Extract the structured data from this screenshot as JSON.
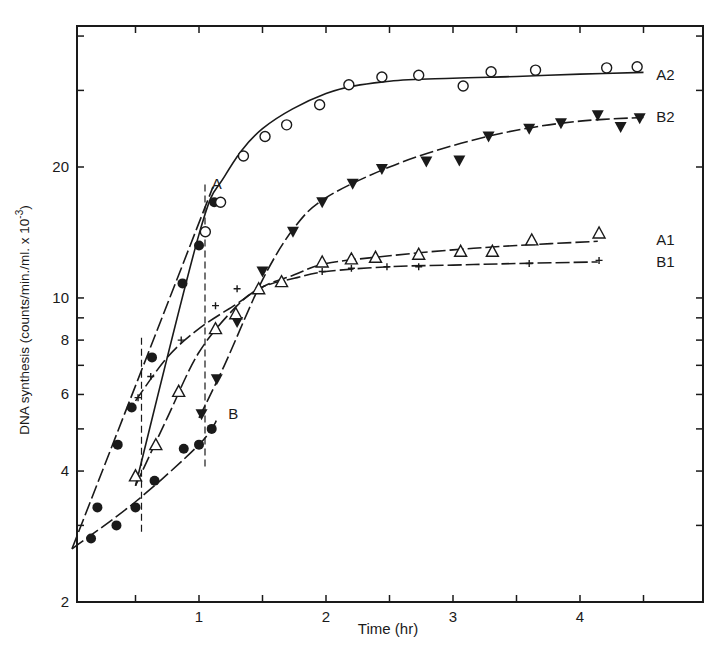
{
  "chart_data": {
    "type": "line",
    "title": "",
    "xlabel": "Time (hr)",
    "ylabel": "DNA synthesis (counts/min./ml. x 10",
    "ylabel_exponent": "-3",
    "ylabel_close": ")",
    "xlim": [
      0,
      4.9
    ],
    "ylim": [
      2,
      41
    ],
    "yscale": "log",
    "grid": false,
    "legend": "inline labels at curve ends",
    "x_ticks": [
      0.5,
      1,
      1.5,
      2,
      2.5,
      3,
      3.5,
      4,
      4.5
    ],
    "x_tick_labels": [
      {
        "v": 1,
        "t": "1"
      },
      {
        "v": 2,
        "t": "2"
      },
      {
        "v": 3,
        "t": "3"
      },
      {
        "v": 4,
        "t": "4"
      }
    ],
    "y_ticks": [
      2,
      3,
      4,
      5,
      6,
      7,
      8,
      9,
      10,
      20,
      30,
      40
    ],
    "y_tick_labels": [
      {
        "v": 2,
        "t": "2"
      },
      {
        "v": 4,
        "t": "4"
      },
      {
        "v": 6,
        "t": "6"
      },
      {
        "v": 8,
        "t": "8"
      },
      {
        "v": 10,
        "t": "10"
      },
      {
        "v": 20,
        "t": "20"
      }
    ],
    "vertical_dashed_lines": [
      {
        "x": 0.5,
        "y_from": 2.9,
        "y_to": 8.1
      },
      {
        "x": 1.0,
        "y_from": 4.1,
        "y_to": 18.5
      }
    ],
    "series": [
      {
        "name": "A",
        "marker": "filled-circle",
        "line": "dashed",
        "label_at": {
          "x": 1.1,
          "y": 18.3
        },
        "curve": [
          [
            0,
            2.65
          ],
          [
            1.11,
            18
          ]
        ],
        "points": [
          [
            0.2,
            3.3
          ],
          [
            0.36,
            4.6
          ],
          [
            0.47,
            5.6
          ],
          [
            0.63,
            7.3
          ],
          [
            0.87,
            10.8
          ],
          [
            1.0,
            13.2
          ],
          [
            1.12,
            16.6
          ]
        ]
      },
      {
        "name": "B",
        "marker": "filled-circle",
        "line": "dashed",
        "label_at": {
          "x": 1.23,
          "y": 5.4
        },
        "curve": [
          [
            0,
            2.65
          ],
          [
            0.5,
            3.4
          ],
          [
            1.0,
            4.6
          ],
          [
            1.15,
            5.3
          ]
        ],
        "points": [
          [
            0.15,
            2.8
          ],
          [
            0.35,
            3.0
          ],
          [
            0.5,
            3.3
          ],
          [
            0.65,
            3.8
          ],
          [
            0.88,
            4.5
          ],
          [
            1.0,
            4.6
          ],
          [
            1.1,
            5.0
          ]
        ]
      },
      {
        "name": "A2",
        "marker": "open-circle",
        "line": "solid",
        "label_at": {
          "x": 4.6,
          "y": 32.5
        },
        "curve": [
          [
            0.5,
            3.7
          ],
          [
            1.0,
            14.0
          ],
          [
            1.2,
            19.0
          ],
          [
            1.5,
            24.5
          ],
          [
            2.0,
            29.5
          ],
          [
            2.5,
            31.5
          ],
          [
            3.0,
            32.0
          ],
          [
            3.5,
            32.3
          ],
          [
            4.0,
            32.7
          ],
          [
            4.5,
            33.0
          ]
        ],
        "points": [
          [
            1.05,
            14.2
          ],
          [
            1.17,
            16.6
          ],
          [
            1.35,
            21.2
          ],
          [
            1.52,
            23.5
          ],
          [
            1.69,
            25.0
          ],
          [
            1.95,
            27.8
          ],
          [
            2.18,
            30.9
          ],
          [
            2.44,
            32.2
          ],
          [
            2.73,
            32.5
          ],
          [
            3.08,
            30.7
          ],
          [
            3.3,
            33.1
          ],
          [
            3.65,
            33.4
          ],
          [
            4.21,
            33.8
          ],
          [
            4.45,
            34.0
          ]
        ]
      },
      {
        "name": "B2",
        "marker": "filled-triangle-down",
        "line": "dashed",
        "label_at": {
          "x": 4.6,
          "y": 26.0
        },
        "curve": [
          [
            1.0,
            5.3
          ],
          [
            1.2,
            7.0
          ],
          [
            1.5,
            11.0
          ],
          [
            1.75,
            14.5
          ],
          [
            2.0,
            17.0
          ],
          [
            2.5,
            20.0
          ],
          [
            3.0,
            22.4
          ],
          [
            3.5,
            24.3
          ],
          [
            4.0,
            25.5
          ],
          [
            4.5,
            26.0
          ]
        ],
        "points": [
          [
            1.02,
            5.4
          ],
          [
            1.14,
            6.5
          ],
          [
            1.3,
            8.8
          ],
          [
            1.5,
            11.5
          ],
          [
            1.74,
            14.2
          ],
          [
            1.97,
            16.6
          ],
          [
            2.21,
            18.3
          ],
          [
            2.44,
            19.8
          ],
          [
            2.79,
            20.6
          ],
          [
            3.05,
            20.7
          ],
          [
            3.28,
            23.5
          ],
          [
            3.6,
            24.5
          ],
          [
            3.85,
            25.2
          ],
          [
            4.14,
            26.3
          ],
          [
            4.32,
            24.7
          ],
          [
            4.47,
            25.9
          ]
        ]
      },
      {
        "name": "A1",
        "marker": "open-triangle",
        "line": "dashed",
        "label_at": {
          "x": 4.6,
          "y": 13.6
        },
        "curve": [
          [
            0.5,
            3.7
          ],
          [
            0.75,
            5.3
          ],
          [
            1.0,
            7.5
          ],
          [
            1.3,
            9.6
          ],
          [
            1.5,
            10.6
          ],
          [
            1.75,
            11.3
          ],
          [
            2.0,
            12.0
          ],
          [
            2.5,
            12.5
          ],
          [
            3.0,
            12.9
          ],
          [
            3.5,
            13.2
          ],
          [
            4.14,
            13.5
          ]
        ],
        "points": [
          [
            0.5,
            3.9
          ],
          [
            0.66,
            4.6
          ],
          [
            0.84,
            6.1
          ],
          [
            1.13,
            8.5
          ],
          [
            1.29,
            9.2
          ],
          [
            1.47,
            10.5
          ],
          [
            1.65,
            10.9
          ],
          [
            1.97,
            12.1
          ],
          [
            2.2,
            12.3
          ],
          [
            2.39,
            12.4
          ],
          [
            2.73,
            12.6
          ],
          [
            3.06,
            12.8
          ],
          [
            3.31,
            12.8
          ],
          [
            3.62,
            13.6
          ],
          [
            4.15,
            14.1
          ]
        ]
      },
      {
        "name": "B1",
        "marker": "plus",
        "line": "dashed",
        "label_at": {
          "x": 4.6,
          "y": 12.1
        },
        "curve": [
          [
            0.5,
            5.8
          ],
          [
            0.75,
            7.3
          ],
          [
            1.0,
            8.5
          ],
          [
            1.3,
            9.7
          ],
          [
            1.5,
            10.6
          ],
          [
            1.75,
            11.1
          ],
          [
            2.0,
            11.5
          ],
          [
            2.5,
            11.8
          ],
          [
            3.0,
            11.9
          ],
          [
            3.5,
            12.0
          ],
          [
            4.14,
            12.1
          ]
        ],
        "points": [
          [
            0.52,
            5.9
          ],
          [
            0.62,
            6.6
          ],
          [
            0.86,
            8.0
          ],
          [
            1.13,
            9.6
          ],
          [
            1.3,
            10.5
          ],
          [
            1.97,
            11.5
          ],
          [
            2.2,
            11.7
          ],
          [
            2.48,
            11.8
          ],
          [
            2.73,
            11.8
          ],
          [
            3.6,
            12.0
          ],
          [
            4.15,
            12.2
          ]
        ]
      }
    ]
  }
}
